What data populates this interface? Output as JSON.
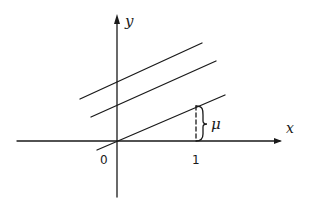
{
  "diagram": {
    "axes": {
      "x_label": "x",
      "y_label": "y",
      "origin_label": "0",
      "x_tick_label": "1"
    },
    "lines": [
      {
        "name": "upper-line",
        "x1": 80,
        "y1": 99,
        "x2": 202,
        "y2": 43
      },
      {
        "name": "middle-line",
        "x1": 91,
        "y1": 117,
        "x2": 216,
        "y2": 61
      },
      {
        "name": "lower-line",
        "x1": 97,
        "y1": 150,
        "x2": 225,
        "y2": 95
      }
    ],
    "annotation": {
      "label": "μ",
      "description": "vertical offset at x = 1"
    },
    "colors": {
      "ink": "#1a1a1a",
      "background": "#ffffff"
    }
  }
}
